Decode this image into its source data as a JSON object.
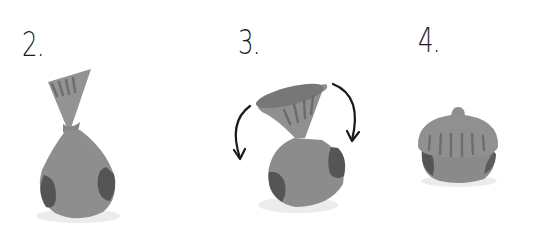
{
  "steps": [
    {
      "label": "2.",
      "description": "sock twisted into a bag shape"
    },
    {
      "label": "3.",
      "description": "cuff folded back over the ball, arrows showing fold direction"
    },
    {
      "label": "4.",
      "description": "finished sock ball with cuff folded over"
    }
  ],
  "colors": {
    "sock_body": "#8c8c8c",
    "sock_dark": "#555555",
    "shadow": "#e6e6e6",
    "ink": "#1a1a1a"
  }
}
